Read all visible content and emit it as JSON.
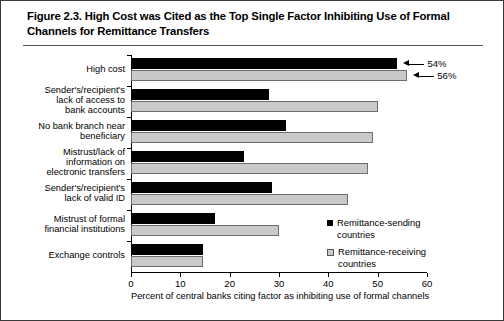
{
  "figure": {
    "title": "Figure 2.3. High Cost was Cited as the Top Single Factor Inhibiting Use of Formal Channels for Remittance Transfers"
  },
  "chart_data": {
    "type": "bar",
    "orientation": "horizontal",
    "title": "Figure 2.3. High Cost was Cited as the Top Single Factor Inhibiting Use of Formal Channels for Remittance Transfers",
    "xlabel": "Percent of central banks citing factor as inhibiting use of formal channels",
    "ylabel": "",
    "xlim": [
      0,
      60
    ],
    "xticks": [
      0,
      10,
      20,
      30,
      40,
      50,
      60
    ],
    "grid": false,
    "legend_position": "inside-right",
    "categories": [
      "High cost",
      "Sender's/recipient's lack of access to bank accounts",
      "No bank branch near beneficiary",
      "Mistrust/lack of information on electronic transfers",
      "Sender's/recipient's lack of valid ID",
      "Mistrust of formal financial institutions",
      "Exchange controls"
    ],
    "category_lines": [
      [
        "High cost"
      ],
      [
        "Sender's/recipient's",
        "lack of access to",
        "bank accounts"
      ],
      [
        "No bank branch near",
        "beneficiary"
      ],
      [
        "Mistrust/lack of",
        "information on",
        "electronic transfers"
      ],
      [
        "Sender's/recipient's",
        "lack of valid ID"
      ],
      [
        "Mistrust of formal",
        "financial institutions"
      ],
      [
        "Exchange controls"
      ]
    ],
    "series": [
      {
        "name": "Remittance-sending countries",
        "color": "#000000",
        "values": [
          54,
          28,
          31.5,
          23,
          28.5,
          17,
          14.5
        ]
      },
      {
        "name": "Remittance-receiving countries",
        "color": "#c9c9c9",
        "values": [
          56,
          50,
          49,
          48,
          44,
          30,
          14.5
        ]
      }
    ],
    "annotations": [
      {
        "text": "54%",
        "series": "Remittance-sending countries",
        "category": "High cost",
        "value": 54
      },
      {
        "text": "56%",
        "series": "Remittance-receiving countries",
        "category": "High cost",
        "value": 56
      }
    ]
  }
}
